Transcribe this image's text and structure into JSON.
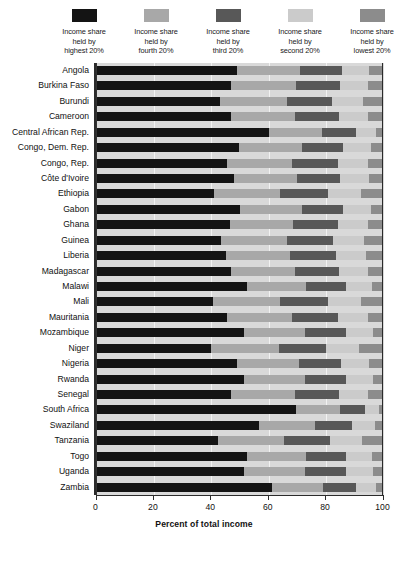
{
  "legend": {
    "items": [
      {
        "label": "Income share\nheld by\nhighest 20%",
        "color": "#141414",
        "name": "highest-20"
      },
      {
        "label": "Income share\nheld by\nfourth 20%",
        "color": "#a8a8a8",
        "name": "fourth-20"
      },
      {
        "label": "Income share\nheld by\nthird 20%",
        "color": "#585858",
        "name": "third-20"
      },
      {
        "label": "Income share\nheld by\nsecond 20%",
        "color": "#cbcbcb",
        "name": "second-20"
      },
      {
        "label": "Income share\nheld by\nlowest 20%",
        "color": "#8c8c8c",
        "name": "lowest-20"
      }
    ]
  },
  "axis": {
    "ticks": [
      "0",
      "20",
      "40",
      "60",
      "80",
      "100"
    ],
    "xlabel": "Percent of total income",
    "min": 0,
    "max": 100
  },
  "chart_data": {
    "type": "bar",
    "orientation": "horizontal",
    "stacked": true,
    "title": "",
    "xlabel": "Percent of total income",
    "ylabel": "",
    "xlim": [
      0,
      100
    ],
    "grid": true,
    "legend_position": "top",
    "colors": [
      "#141414",
      "#a8a8a8",
      "#585858",
      "#cbcbcb",
      "#8c8c8c"
    ],
    "series": [
      {
        "name": "Income share held by highest 20%",
        "color": "#141414"
      },
      {
        "name": "Income share held by fourth 20%",
        "color": "#a8a8a8"
      },
      {
        "name": "Income share held by third 20%",
        "color": "#585858"
      },
      {
        "name": "Income share held by second 20%",
        "color": "#cbcbcb"
      },
      {
        "name": "Income share held by lowest 20%",
        "color": "#8c8c8c"
      }
    ],
    "categories": [
      "Angola",
      "Burkina Faso",
      "Burundi",
      "Cameroon",
      "Central African Rep.",
      "Congo, Dem. Rep.",
      "Congo, Rep.",
      "Côte d'Ivoire",
      "Ethiopia",
      "Gabon",
      "Ghana",
      "Guinea",
      "Liberia",
      "Madagascar",
      "Malawi",
      "Mali",
      "Mauritania",
      "Mozambique",
      "Niger",
      "Nigeria",
      "Rwanda",
      "Senegal",
      "South Africa",
      "Swaziland",
      "Tanzania",
      "Togo",
      "Uganda",
      "Zambia"
    ],
    "rows": [
      {
        "country": "Angola",
        "values": [
          48.8,
          22.0,
          14.8,
          9.4,
          5.0
        ]
      },
      {
        "country": "Burkina Faso",
        "values": [
          47.0,
          22.5,
          15.2,
          9.8,
          5.5
        ]
      },
      {
        "country": "Burundi",
        "values": [
          42.9,
          23.5,
          15.8,
          10.5,
          7.3
        ]
      },
      {
        "country": "Cameroon",
        "values": [
          47.0,
          22.0,
          15.5,
          10.0,
          5.5
        ]
      },
      {
        "country": "Central African Rep.",
        "values": [
          60.0,
          18.5,
          12.0,
          7.0,
          2.5
        ]
      },
      {
        "country": "Congo, Dem. Rep.",
        "values": [
          49.5,
          22.0,
          14.5,
          9.5,
          4.5
        ]
      },
      {
        "country": "Congo, Rep.",
        "values": [
          45.5,
          22.5,
          16.0,
          10.5,
          5.5
        ]
      },
      {
        "country": "Côte d'Ivoire",
        "values": [
          48.0,
          22.0,
          15.0,
          9.8,
          5.2
        ]
      },
      {
        "country": "Ethiopia",
        "values": [
          41.0,
          23.0,
          16.5,
          11.5,
          8.0
        ]
      },
      {
        "country": "Gabon",
        "values": [
          50.0,
          21.5,
          14.5,
          9.5,
          4.5
        ]
      },
      {
        "country": "Ghana",
        "values": [
          46.5,
          22.0,
          15.5,
          10.5,
          5.5
        ]
      },
      {
        "country": "Guinea",
        "values": [
          43.5,
          23.0,
          16.0,
          10.8,
          6.7
        ]
      },
      {
        "country": "Liberia",
        "values": [
          45.0,
          22.5,
          16.0,
          10.5,
          6.0
        ]
      },
      {
        "country": "Madagascar",
        "values": [
          47.0,
          22.0,
          15.5,
          10.0,
          5.5
        ]
      },
      {
        "country": "Malawi",
        "values": [
          52.5,
          20.5,
          14.0,
          9.0,
          4.0
        ]
      },
      {
        "country": "Mali",
        "values": [
          40.5,
          23.5,
          16.5,
          11.5,
          8.0
        ]
      },
      {
        "country": "Mauritania",
        "values": [
          45.5,
          22.5,
          16.0,
          10.5,
          5.5
        ]
      },
      {
        "country": "Mozambique",
        "values": [
          51.5,
          21.0,
          14.5,
          9.3,
          3.7
        ]
      },
      {
        "country": "Niger",
        "values": [
          40.0,
          23.5,
          16.5,
          11.5,
          8.5
        ]
      },
      {
        "country": "Nigeria",
        "values": [
          49.0,
          21.5,
          14.8,
          9.7,
          5.0
        ]
      },
      {
        "country": "Rwanda",
        "values": [
          51.5,
          21.0,
          14.5,
          9.3,
          3.7
        ]
      },
      {
        "country": "Senegal",
        "values": [
          47.0,
          22.0,
          15.5,
          10.0,
          5.5
        ]
      },
      {
        "country": "South Africa",
        "values": [
          69.5,
          15.5,
          8.5,
          4.8,
          1.7
        ]
      },
      {
        "country": "Swaziland",
        "values": [
          56.5,
          19.5,
          13.0,
          8.0,
          3.0
        ]
      },
      {
        "country": "Tanzania",
        "values": [
          42.5,
          23.0,
          16.0,
          11.0,
          7.5
        ]
      },
      {
        "country": "Togo",
        "values": [
          52.5,
          20.5,
          14.0,
          9.0,
          4.0
        ]
      },
      {
        "country": "Uganda",
        "values": [
          51.5,
          21.0,
          14.5,
          9.3,
          3.7
        ]
      },
      {
        "country": "Zambia",
        "values": [
          61.0,
          18.0,
          11.5,
          7.0,
          2.5
        ]
      }
    ]
  }
}
